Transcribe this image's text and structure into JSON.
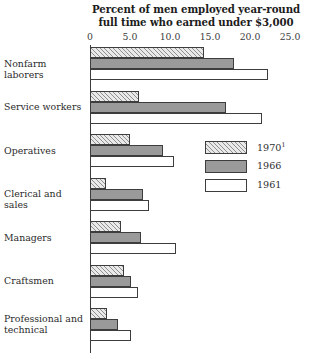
{
  "chart_data": {
    "type": "bar",
    "orientation": "horizontal",
    "title": "Percent of men employed year-round full time who earned under $3,000",
    "title_line1": "Percent of men employed year-round",
    "title_line2": "full time who earned under $3,000",
    "xlabel": "",
    "ylabel": "",
    "xlim": [
      0,
      25
    ],
    "grid": false,
    "legend_position": "center-right",
    "tick_labels": [
      "0",
      "5.0",
      "10.0",
      "15.0",
      "20.0",
      "25.0"
    ],
    "tick_values": [
      0,
      5,
      10,
      15,
      20,
      25
    ],
    "categories": [
      "Nonfarm laborers",
      "Service workers",
      "Operatives",
      "Clerical and sales",
      "Managers",
      "Craftsmen",
      "Professional and technical"
    ],
    "series": [
      {
        "name": "1970",
        "legend_label": "1970",
        "legend_footnote": "1",
        "values": [
          14.2,
          6.1,
          5.0,
          2.0,
          3.9,
          4.2,
          2.1
        ]
      },
      {
        "name": "1966",
        "legend_label": "1966",
        "legend_footnote": "",
        "values": [
          18.0,
          17.0,
          9.1,
          6.6,
          6.4,
          5.1,
          3.5
        ]
      },
      {
        "name": "1961",
        "legend_label": "1961",
        "legend_footnote": "",
        "values": [
          22.3,
          21.5,
          10.5,
          7.4,
          10.8,
          6.0,
          5.1
        ]
      }
    ],
    "colors": {
      "1970": "#e9e9e9",
      "1966": "#9a9a9a",
      "1961": "#ffffff",
      "outline": "#3d3d3d",
      "axis": "#3a3a3a",
      "text": "#2b2b2b"
    }
  },
  "legend": {
    "items": [
      {
        "label": "1970",
        "footnote": "1",
        "pattern": "hatched"
      },
      {
        "label": "1966",
        "footnote": "",
        "pattern": "solid-gray"
      },
      {
        "label": "1961",
        "footnote": "",
        "pattern": "white"
      }
    ]
  },
  "axis": {
    "labels": [
      "0",
      "5.0",
      "10.0",
      "15.0",
      "20.0",
      "25.0"
    ]
  },
  "categories": {
    "items": [
      {
        "label": "Nonfarm laborers"
      },
      {
        "label": "Service workers"
      },
      {
        "label": "Operatives"
      },
      {
        "label": "Clerical and sales"
      },
      {
        "label": "Managers"
      },
      {
        "label": "Craftsmen"
      },
      {
        "label": "Professional and",
        "label2": "technical"
      }
    ]
  }
}
